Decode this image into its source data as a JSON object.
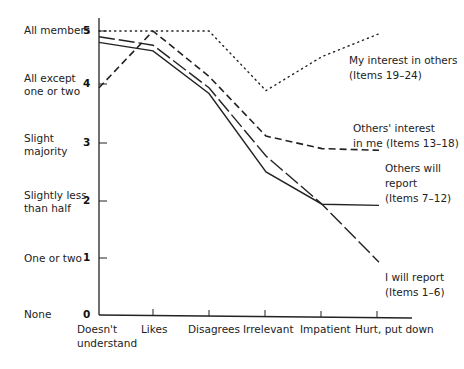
{
  "chart_data": {
    "type": "line",
    "title": "",
    "xlabel": "",
    "ylabel": "",
    "ylim": [
      0,
      5
    ],
    "grid": false,
    "legend_position": "inline-right",
    "categories": [
      "Doesn't understand",
      "Likes",
      "Disagrees",
      "Irrelevant",
      "Impatient",
      "Hurt, put down"
    ],
    "y_ticks": [
      0,
      1,
      2,
      3,
      4,
      5
    ],
    "y_tick_labels": [
      "None",
      "One or two",
      "Slightly less than half",
      "Slight majority",
      "All except one or two",
      "All members"
    ],
    "series": [
      {
        "name": "My interest in others (Items 19–24)",
        "style": "dotted",
        "values": [
          5.0,
          5.0,
          5.0,
          3.95,
          4.55,
          4.95
        ]
      },
      {
        "name": "Others' interest in me (Items 13–18)",
        "style": "dashed",
        "values": [
          4.0,
          5.0,
          4.2,
          3.15,
          2.93,
          2.9
        ]
      },
      {
        "name": "Others will report (Items 7–12)",
        "style": "solid",
        "values": [
          4.8,
          4.65,
          3.9,
          2.52,
          1.95,
          1.93
        ]
      },
      {
        "name": "I will report (Items 1–6)",
        "style": "long-dash",
        "values": [
          4.9,
          4.75,
          4.0,
          2.8,
          1.95,
          0.93
        ]
      }
    ]
  },
  "y_axis": {
    "labels": [
      {
        "value": "5",
        "text": "All members"
      },
      {
        "value": "4",
        "text_line1": "All except",
        "text_line2": "one or two"
      },
      {
        "value": "3",
        "text_line1": "Slight",
        "text_line2": "majority"
      },
      {
        "value": "2",
        "text_line1": "Slightly less",
        "text_line2": "than half"
      },
      {
        "value": "1",
        "text": "One or two"
      },
      {
        "value": "0",
        "text": "None"
      }
    ]
  },
  "x_axis": {
    "labels": [
      {
        "line1": "Doesn't",
        "line2": "understand"
      },
      {
        "line1": "Likes"
      },
      {
        "line1": "Disagrees"
      },
      {
        "line1": "Irrelevant"
      },
      {
        "line1": "Impatient"
      },
      {
        "line1": "Hurt, put down"
      }
    ]
  },
  "series_labels": {
    "my_interest": {
      "line1": "My interest  in others",
      "line2": "(Items 19–24)"
    },
    "others_interest": {
      "line1": "Others' interest",
      "line2": "in me (Items 13–18)"
    },
    "others_report": {
      "line1": "Others will",
      "line2": "report",
      "line3": "(Items 7–12)"
    },
    "i_report": {
      "line1": "I will report",
      "line2": "(Items 1–6)"
    }
  }
}
